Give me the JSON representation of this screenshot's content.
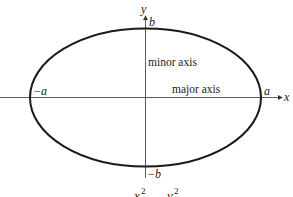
{
  "diagram": {
    "type": "ellipse",
    "axes": {
      "x_label": "x",
      "y_label": "y"
    },
    "vertices": {
      "left": "−a",
      "right": "a",
      "top": "b",
      "bottom": "−b"
    },
    "annotations": {
      "minor_axis": "minor axis",
      "major_axis": "major axis"
    },
    "equation_fragment": {
      "left_term": "x",
      "left_exp": "2",
      "right_term": "y",
      "right_exp": "2"
    },
    "colors": {
      "curve": "#1a1a1a",
      "axis": "#333333",
      "text": "#222222"
    }
  }
}
